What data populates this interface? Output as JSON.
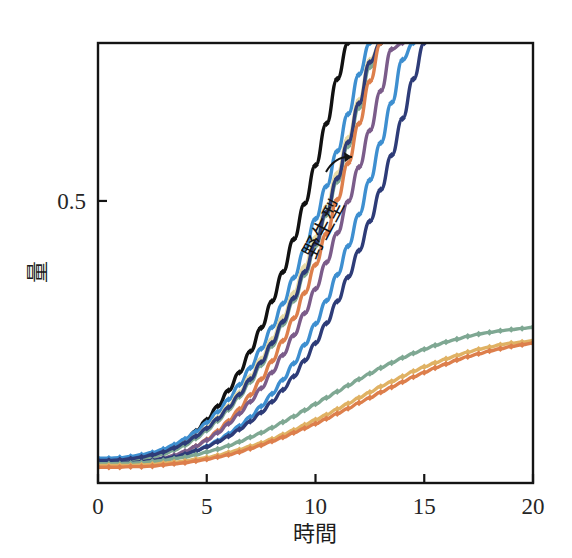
{
  "figure": {
    "background_color": "#ffffff",
    "frame_color": "#141414"
  },
  "axes": {
    "x": {
      "title": "時間",
      "ticks": [
        "0",
        "5",
        "10",
        "15",
        "20"
      ],
      "tick_values": [
        0,
        5,
        10,
        15,
        20
      ],
      "range": [
        0,
        20
      ]
    },
    "y": {
      "title": "量",
      "ticks": [
        "0.5"
      ],
      "tick_values": [
        0.5
      ],
      "range": [
        0,
        0.78
      ]
    }
  },
  "annotations": [
    {
      "text": "野生型",
      "name": "wild-type-annotation",
      "points_to": "wild type (black) curve",
      "icon": "curved-arrow-icon"
    }
  ],
  "chart_data": {
    "type": "line",
    "title": "",
    "xlabel": "時間",
    "ylabel": "量",
    "xlim": [
      0,
      20
    ],
    "ylim": [
      0,
      0.78
    ],
    "grid": false,
    "legend_position": "none",
    "marker": "diamond",
    "x": [
      0,
      0.5,
      1,
      1.5,
      2,
      2.5,
      3,
      3.5,
      4,
      4.5,
      5,
      5.5,
      6,
      6.5,
      7,
      7.5,
      8,
      8.5,
      9,
      9.5,
      10,
      10.5,
      11,
      11.5,
      12,
      12.5,
      13,
      13.5,
      14,
      14.5,
      15,
      15.5,
      16,
      16.5,
      17,
      17.5,
      18,
      18.5,
      19,
      19.5,
      20
    ],
    "series": [
      {
        "name": "野生型",
        "label": "wild type",
        "color": "#111111",
        "values": [
          0.035,
          0.035,
          0.036,
          0.038,
          0.041,
          0.046,
          0.053,
          0.063,
          0.076,
          0.092,
          0.112,
          0.136,
          0.164,
          0.196,
          0.233,
          0.275,
          0.322,
          0.374,
          0.432,
          0.495,
          0.563,
          0.637,
          0.716,
          0.78,
          null,
          null,
          null,
          null,
          null,
          null,
          null,
          null,
          null,
          null,
          null,
          null,
          null,
          null,
          null,
          null,
          null
        ]
      },
      {
        "name": "変異体1",
        "label": "mutant 1",
        "color": "#3E8FD0",
        "values": [
          0.044,
          0.044,
          0.045,
          0.047,
          0.05,
          0.054,
          0.06,
          0.068,
          0.078,
          0.091,
          0.107,
          0.126,
          0.148,
          0.174,
          0.204,
          0.238,
          0.276,
          0.318,
          0.364,
          0.414,
          0.468,
          0.526,
          0.588,
          0.654,
          0.724,
          0.78,
          null,
          null,
          null,
          null,
          null,
          null,
          null,
          null,
          null,
          null,
          null,
          null,
          null,
          null,
          null
        ]
      },
      {
        "name": "変異体2",
        "label": "mutant 2",
        "color": "#E8DCA8",
        "values": [
          0.038,
          0.038,
          0.039,
          0.041,
          0.044,
          0.048,
          0.054,
          0.061,
          0.071,
          0.083,
          0.098,
          0.116,
          0.137,
          0.161,
          0.189,
          0.22,
          0.255,
          0.294,
          0.337,
          0.384,
          0.435,
          0.49,
          0.549,
          0.612,
          0.679,
          0.75,
          0.78,
          null,
          null,
          null,
          null,
          null,
          null,
          null,
          null,
          null,
          null,
          null,
          null,
          null,
          null
        ]
      },
      {
        "name": "変異体3",
        "label": "mutant 3",
        "color": "#7FA893",
        "values": [
          0.036,
          0.036,
          0.037,
          0.039,
          0.042,
          0.046,
          0.051,
          0.058,
          0.067,
          0.079,
          0.093,
          0.11,
          0.13,
          0.153,
          0.179,
          0.209,
          0.243,
          0.281,
          0.323,
          0.369,
          0.42,
          0.475,
          0.534,
          0.597,
          0.665,
          0.737,
          0.78,
          null,
          null,
          null,
          null,
          null,
          null,
          null,
          null,
          null,
          null,
          null,
          null,
          null,
          null
        ]
      },
      {
        "name": "変異体4",
        "label": "mutant 4",
        "color": "#2E3C78",
        "values": [
          0.04,
          0.04,
          0.041,
          0.043,
          0.046,
          0.05,
          0.055,
          0.062,
          0.071,
          0.083,
          0.097,
          0.114,
          0.134,
          0.157,
          0.184,
          0.214,
          0.248,
          0.286,
          0.328,
          0.374,
          0.425,
          0.48,
          0.54,
          0.604,
          0.673,
          0.746,
          0.78,
          null,
          null,
          null,
          null,
          null,
          null,
          null,
          null,
          null,
          null,
          null,
          null,
          null,
          null
        ]
      },
      {
        "name": "変異体5",
        "label": "mutant 5",
        "color": "#DD7F4C",
        "values": [
          0.03,
          0.03,
          0.031,
          0.032,
          0.034,
          0.037,
          0.041,
          0.047,
          0.055,
          0.065,
          0.077,
          0.092,
          0.11,
          0.131,
          0.156,
          0.184,
          0.216,
          0.252,
          0.292,
          0.337,
          0.387,
          0.442,
          0.502,
          0.567,
          0.637,
          0.712,
          0.78,
          null,
          null,
          null,
          null,
          null,
          null,
          null,
          null,
          null,
          null,
          null,
          null,
          null,
          null
        ]
      },
      {
        "name": "変異体6",
        "label": "mutant 6",
        "color": "#7B5C8A",
        "values": [
          0.033,
          0.033,
          0.034,
          0.035,
          0.037,
          0.04,
          0.044,
          0.049,
          0.056,
          0.065,
          0.076,
          0.089,
          0.105,
          0.123,
          0.144,
          0.168,
          0.196,
          0.227,
          0.262,
          0.301,
          0.344,
          0.391,
          0.443,
          0.499,
          0.56,
          0.625,
          0.695,
          0.769,
          0.78,
          null,
          null,
          null,
          null,
          null,
          null,
          null,
          null,
          null,
          null,
          null,
          null
        ]
      },
      {
        "name": "変異体7",
        "label": "mutant 7",
        "color": "#3E8FD0",
        "values": [
          0.032,
          0.032,
          0.033,
          0.034,
          0.036,
          0.038,
          0.041,
          0.045,
          0.05,
          0.057,
          0.065,
          0.075,
          0.087,
          0.101,
          0.117,
          0.136,
          0.158,
          0.183,
          0.212,
          0.245,
          0.282,
          0.323,
          0.369,
          0.42,
          0.476,
          0.537,
          0.603,
          0.674,
          0.75,
          0.78,
          null,
          null,
          null,
          null,
          null,
          null,
          null,
          null,
          null,
          null,
          null
        ]
      },
      {
        "name": "変異体8",
        "label": "mutant 8",
        "color": "#2E3C78",
        "values": [
          0.035,
          0.035,
          0.035,
          0.036,
          0.038,
          0.04,
          0.043,
          0.046,
          0.051,
          0.057,
          0.064,
          0.073,
          0.083,
          0.095,
          0.109,
          0.125,
          0.144,
          0.165,
          0.189,
          0.217,
          0.248,
          0.283,
          0.322,
          0.365,
          0.412,
          0.464,
          0.52,
          0.581,
          0.646,
          0.716,
          0.78,
          null,
          null,
          null,
          null,
          null,
          null,
          null,
          null,
          null,
          null
        ]
      },
      {
        "name": "変異体9",
        "label": "mutant 9",
        "color": "#7FA893",
        "values": [
          0.034,
          0.034,
          0.034,
          0.035,
          0.036,
          0.038,
          0.04,
          0.043,
          0.046,
          0.05,
          0.055,
          0.06,
          0.066,
          0.073,
          0.081,
          0.089,
          0.098,
          0.108,
          0.118,
          0.129,
          0.14,
          0.151,
          0.162,
          0.173,
          0.184,
          0.194,
          0.204,
          0.213,
          0.222,
          0.23,
          0.237,
          0.244,
          0.25,
          0.255,
          0.26,
          0.264,
          0.267,
          0.27,
          0.272,
          0.274,
          0.276
        ]
      },
      {
        "name": "変異体10",
        "label": "mutant 10",
        "color": "#E0B264",
        "values": [
          0.031,
          0.031,
          0.031,
          0.031,
          0.032,
          0.033,
          0.035,
          0.037,
          0.039,
          0.042,
          0.045,
          0.049,
          0.054,
          0.059,
          0.065,
          0.071,
          0.078,
          0.086,
          0.094,
          0.103,
          0.112,
          0.121,
          0.131,
          0.141,
          0.151,
          0.161,
          0.171,
          0.18,
          0.189,
          0.198,
          0.206,
          0.213,
          0.22,
          0.226,
          0.232,
          0.237,
          0.241,
          0.245,
          0.248,
          0.25,
          0.252
        ]
      },
      {
        "name": "変異体11",
        "label": "mutant 11",
        "color": "#DD7F4C",
        "values": [
          0.028,
          0.028,
          0.028,
          0.029,
          0.029,
          0.03,
          0.032,
          0.034,
          0.036,
          0.039,
          0.042,
          0.046,
          0.05,
          0.055,
          0.061,
          0.067,
          0.074,
          0.081,
          0.089,
          0.097,
          0.105,
          0.114,
          0.123,
          0.132,
          0.142,
          0.151,
          0.161,
          0.17,
          0.179,
          0.188,
          0.196,
          0.204,
          0.211,
          0.218,
          0.224,
          0.229,
          0.234,
          0.238,
          0.242,
          0.245,
          0.248
        ]
      }
    ]
  }
}
